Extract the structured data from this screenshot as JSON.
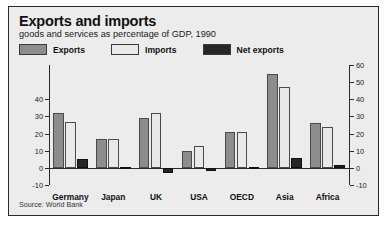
{
  "chart_data": {
    "type": "bar",
    "title": "Exports and imports",
    "subtitle": "goods and services as percentage of GDP, 1990",
    "source": "Source: World Bank",
    "xlabel": "",
    "ylabel": "",
    "ylim": [
      -10,
      60
    ],
    "yticks": [
      -10,
      0,
      10,
      20,
      30,
      40,
      50,
      60
    ],
    "yticklabels_left": [
      "40",
      "30",
      "20",
      "10",
      "0",
      "-10"
    ],
    "yticklabels_right": [
      "60",
      "50",
      "40",
      "30",
      "20",
      "10",
      "0",
      "-10"
    ],
    "grid": false,
    "legend_position": "top-left",
    "categories": [
      "Germany",
      "Japan",
      "UK",
      "USA",
      "OECD",
      "Asia",
      "Africa"
    ],
    "series": [
      {
        "name": "Exports",
        "color": "#8d8d8d",
        "values": [
          32,
          17,
          29,
          10,
          21,
          55,
          26
        ]
      },
      {
        "name": "Imports",
        "color": "#e9e9e9",
        "values": [
          27,
          17,
          32,
          13,
          21,
          47,
          24
        ]
      },
      {
        "name": "Net exports",
        "color": "#262626",
        "values": [
          5,
          0.5,
          -3,
          -2,
          0.5,
          6,
          1.5
        ]
      }
    ]
  },
  "legend": {
    "items": [
      {
        "label": "Exports",
        "swatch": "#8d8d8d"
      },
      {
        "label": "Imports",
        "swatch": "#e9e9e9"
      },
      {
        "label": "Net exports",
        "swatch": "#262626"
      }
    ]
  }
}
